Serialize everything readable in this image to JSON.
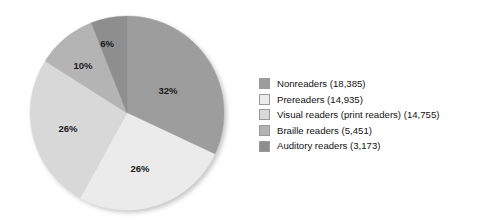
{
  "chart_data": {
    "type": "pie",
    "title": "",
    "subtitle": "",
    "xlabel": "",
    "ylabel": "",
    "legend_position": "right",
    "grid": false,
    "categories": [
      "Nonreaders",
      "Prereaders",
      "Visual readers (print readers)",
      "Braille readers",
      "Auditory readers"
    ],
    "values": [
      18385,
      14935,
      14755,
      5451,
      3173
    ],
    "percentages": [
      32,
      26,
      26,
      10,
      6
    ],
    "percent_labels": [
      "32%",
      "26%",
      "26%",
      "10%",
      "6%"
    ],
    "legend_entries": [
      "Nonreaders (18,385)",
      "Prereaders (14,935)",
      "Visual readers (print readers) (14,755)",
      "Braille readers (5,451)",
      "Auditory readers (3,173)"
    ],
    "colors": [
      "#9d9d9d",
      "#ebebeb",
      "#d8d8d8",
      "#b4b4b4",
      "#8e8e8e"
    ],
    "slices": [
      {
        "name": "Nonreaders",
        "count": 18385,
        "percent": 32,
        "percent_label": "32%",
        "color": "#9d9d9d",
        "start_angle": 0,
        "end_angle": 115.2,
        "label_x": 168,
        "label_y": 90
      },
      {
        "name": "Prereaders",
        "count": 14935,
        "percent": 26,
        "percent_label": "26%",
        "color": "#ebebeb",
        "start_angle": 115.2,
        "end_angle": 208.8,
        "label_x": 140,
        "label_y": 168
      },
      {
        "name": "Visual readers (print readers)",
        "count": 14755,
        "percent": 26,
        "percent_label": "26%",
        "color": "#d8d8d8",
        "start_angle": 208.8,
        "end_angle": 302.4,
        "label_x": 68,
        "label_y": 128
      },
      {
        "name": "Braille readers",
        "count": 5451,
        "percent": 10,
        "percent_label": "10%",
        "color": "#b4b4b4",
        "start_angle": 302.4,
        "end_angle": 338.4,
        "label_x": 83,
        "label_y": 65
      },
      {
        "name": "Auditory readers",
        "count": 3173,
        "percent": 6,
        "percent_label": "6%",
        "color": "#8e8e8e",
        "start_angle": 338.4,
        "end_angle": 360,
        "label_x": 107,
        "label_y": 43
      }
    ],
    "geometry": {
      "center_x": 127,
      "center_y": 113,
      "radius": 97
    }
  }
}
